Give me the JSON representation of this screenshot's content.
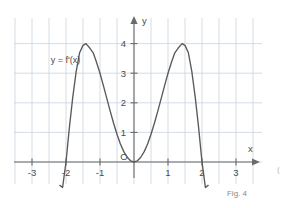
{
  "figure": {
    "caption": "Fig. 4",
    "edge_mark": "(",
    "curve_label": "y = f'(x)",
    "origin_label": "O",
    "x_axis_label": "x",
    "y_axis_label": "y"
  },
  "colors": {
    "grid": "#c8d4e0",
    "axis": "#6b6b6b",
    "curve": "#5a5a5a",
    "text": "#4a4a4a",
    "caption": "#8a8a8a",
    "background": "#ffffff"
  },
  "chart_data": {
    "type": "line",
    "title": "",
    "subtitle": "",
    "xlabel": "x",
    "ylabel": "y",
    "xlim": [
      -3.6,
      3.6
    ],
    "ylim": [
      -0.85,
      4.7
    ],
    "grid": true,
    "legend_position": "inside-upper-left",
    "x_ticks": [
      -3,
      -2,
      -1,
      0,
      1,
      2,
      3
    ],
    "x_tick_labels": [
      "-3",
      "-2",
      "-1",
      "O",
      "1",
      "2",
      "3"
    ],
    "y_ticks": [
      1,
      2,
      3,
      4
    ],
    "y_tick_labels": [
      "1",
      "2",
      "3",
      "4"
    ],
    "annotations": [
      {
        "text": "y = f'(x)",
        "x": -2.45,
        "y": 3.35
      }
    ],
    "series": [
      {
        "name": "y = f'(x)",
        "color": "#5a5a5a",
        "equation": "x^2 (4 - x^2)",
        "roots": [
          -2,
          0,
          2
        ],
        "maxima": [
          {
            "x": -1.414,
            "y": 4
          },
          {
            "x": 1.414,
            "y": 4
          }
        ],
        "minima": [
          {
            "x": 0,
            "y": 0
          }
        ],
        "x": [
          -2.18,
          -2.1,
          -2.0,
          -1.9,
          -1.8,
          -1.7,
          -1.6,
          -1.5,
          -1.414,
          -1.3,
          -1.2,
          -1.1,
          -1.0,
          -0.9,
          -0.8,
          -0.7,
          -0.6,
          -0.5,
          -0.4,
          -0.3,
          -0.2,
          -0.1,
          0.0,
          0.1,
          0.2,
          0.3,
          0.4,
          0.5,
          0.6,
          0.7,
          0.8,
          0.9,
          1.0,
          1.1,
          1.2,
          1.3,
          1.414,
          1.5,
          1.6,
          1.7,
          1.8,
          1.9,
          2.0,
          2.1,
          2.18
        ],
        "values": [
          -0.79,
          -0.86,
          0.0,
          1.17,
          2.2,
          3.06,
          3.69,
          3.94,
          4.0,
          3.85,
          3.69,
          3.36,
          3.0,
          2.58,
          2.15,
          1.72,
          1.31,
          0.94,
          0.61,
          0.35,
          0.16,
          0.04,
          0.0,
          0.04,
          0.16,
          0.35,
          0.61,
          0.94,
          1.31,
          1.72,
          2.15,
          2.58,
          3.0,
          3.36,
          3.69,
          3.85,
          4.0,
          3.94,
          3.69,
          3.06,
          2.2,
          1.17,
          0.0,
          -0.86,
          -0.79
        ]
      }
    ]
  }
}
